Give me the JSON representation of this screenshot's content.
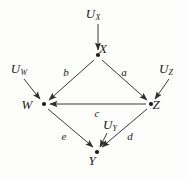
{
  "figure": {
    "type": "causal-dag",
    "background_color": "#fdfdfc",
    "stroke_color": "#3a3a3a",
    "text_color": "#1b1b1b"
  },
  "nodes": [
    {
      "id": "X",
      "label": "X",
      "x": 98,
      "y": 55,
      "label_x": 103,
      "label_y": 48
    },
    {
      "id": "W",
      "label": "W",
      "x": 44,
      "y": 104,
      "label_x": 27,
      "label_y": 104
    },
    {
      "id": "Z",
      "label": "Z",
      "x": 151,
      "y": 104,
      "label_x": 156,
      "label_y": 104
    },
    {
      "id": "Y",
      "label": "Y",
      "x": 97,
      "y": 152,
      "label_x": 92,
      "label_y": 160
    }
  ],
  "exogenous": [
    {
      "id": "U_X",
      "base": "U",
      "sub": "X",
      "label_x": 93,
      "label_y": 14,
      "from_x": 98,
      "from_y": 24,
      "to_x": 98,
      "to_y": 50
    },
    {
      "id": "U_W",
      "base": "U",
      "sub": "W",
      "label_x": 19,
      "label_y": 69,
      "from_x": 24,
      "from_y": 79,
      "to_x": 40,
      "to_y": 99
    },
    {
      "id": "U_Z",
      "base": "U",
      "sub": "Z",
      "label_x": 166,
      "label_y": 69,
      "from_x": 169,
      "from_y": 79,
      "to_x": 155,
      "to_y": 99
    },
    {
      "id": "U_Y",
      "base": "U",
      "sub": "Y",
      "label_x": 110,
      "label_y": 125,
      "from_x": 107,
      "from_y": 133,
      "to_x": 100,
      "to_y": 147
    }
  ],
  "edges": [
    {
      "id": "b",
      "label": "b",
      "from": "X",
      "to": "W",
      "from_x": 94,
      "from_y": 60,
      "to_x": 49,
      "to_y": 100,
      "label_x": 66,
      "label_y": 72
    },
    {
      "id": "a",
      "label": "a",
      "from": "X",
      "to": "Z",
      "from_x": 102,
      "from_y": 60,
      "to_x": 147,
      "to_y": 100,
      "label_x": 124,
      "label_y": 72
    },
    {
      "id": "c",
      "label": "c",
      "from": "Z",
      "to": "W",
      "from_x": 146,
      "from_y": 104,
      "to_x": 50,
      "to_y": 104,
      "label_x": 97,
      "label_y": 113
    },
    {
      "id": "e",
      "label": "e",
      "from": "W",
      "to": "Y",
      "from_x": 48,
      "from_y": 109,
      "to_x": 93,
      "to_y": 147,
      "label_x": 64,
      "label_y": 136
    },
    {
      "id": "d",
      "label": "d",
      "from": "Z",
      "to": "Y",
      "from_x": 147,
      "from_y": 109,
      "to_x": 102,
      "to_y": 147,
      "label_x": 130,
      "label_y": 136
    }
  ],
  "chart_data": {
    "type": "diagram",
    "title": "",
    "node_labels": [
      "X",
      "W",
      "Z",
      "Y"
    ],
    "exogenous_labels": [
      "U_X",
      "U_W",
      "U_Z",
      "U_Y"
    ],
    "edge_labels": [
      "a",
      "b",
      "c",
      "d",
      "e"
    ],
    "directed_edges": [
      {
        "from": "U_X",
        "to": "X",
        "coefficient": ""
      },
      {
        "from": "U_W",
        "to": "W",
        "coefficient": ""
      },
      {
        "from": "U_Z",
        "to": "Z",
        "coefficient": ""
      },
      {
        "from": "U_Y",
        "to": "Y",
        "coefficient": ""
      },
      {
        "from": "X",
        "to": "W",
        "coefficient": "b"
      },
      {
        "from": "X",
        "to": "Z",
        "coefficient": "a"
      },
      {
        "from": "Z",
        "to": "W",
        "coefficient": "c"
      },
      {
        "from": "W",
        "to": "Y",
        "coefficient": "e"
      },
      {
        "from": "Z",
        "to": "Y",
        "coefficient": "d"
      }
    ]
  }
}
